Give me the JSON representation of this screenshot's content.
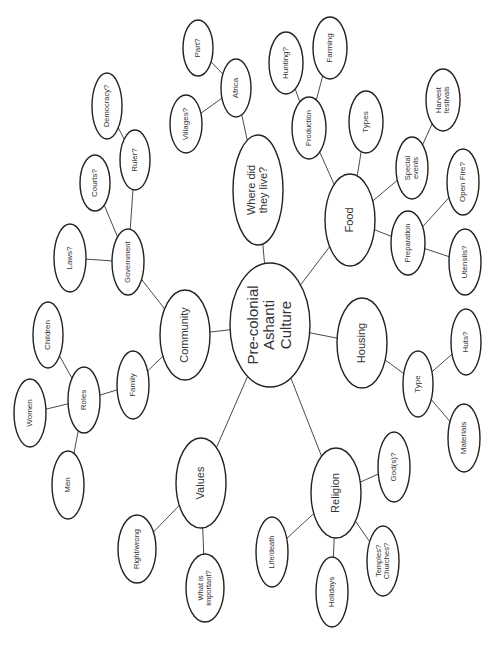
{
  "diagram": {
    "title": "Pre-colonial Ashanti Culture",
    "type": "mind-map",
    "orientation": "rotated-90-ccw",
    "colors": {
      "background": "#ffffff",
      "node_stroke": "#222222",
      "edge_stroke": "#4a4a4a",
      "text": "#333333"
    },
    "nodes": [
      {
        "id": "center",
        "lines": [
          "Pre-colonial",
          "Ashanti",
          "Culture"
        ],
        "cx": 270,
        "cy": 325,
        "rx": 40,
        "ry": 62,
        "size": 15
      },
      {
        "id": "where",
        "lines": [
          "Where did",
          "they live?"
        ],
        "cx": 258,
        "cy": 190,
        "rx": 25,
        "ry": 55,
        "size": 11
      },
      {
        "id": "africa",
        "lines": [
          "Africa"
        ],
        "cx": 236,
        "cy": 88,
        "rx": 15,
        "ry": 29,
        "size": 8
      },
      {
        "id": "part",
        "lines": [
          "Part?"
        ],
        "cx": 198,
        "cy": 48,
        "rx": 15,
        "ry": 28,
        "size": 8
      },
      {
        "id": "villages",
        "lines": [
          "Villages?"
        ],
        "cx": 186,
        "cy": 124,
        "rx": 16,
        "ry": 29,
        "size": 8
      },
      {
        "id": "community",
        "lines": [
          "Community"
        ],
        "cx": 185,
        "cy": 335,
        "rx": 25,
        "ry": 45,
        "size": 11
      },
      {
        "id": "government",
        "lines": [
          "Government"
        ],
        "cx": 128,
        "cy": 262,
        "rx": 16,
        "ry": 33,
        "size": 7.5
      },
      {
        "id": "ruler",
        "lines": [
          "Ruler?"
        ],
        "cx": 135,
        "cy": 160,
        "rx": 15,
        "ry": 30,
        "size": 8
      },
      {
        "id": "democracy",
        "lines": [
          "Democracy?"
        ],
        "cx": 107,
        "cy": 106,
        "rx": 15,
        "ry": 33,
        "size": 7.5
      },
      {
        "id": "courts",
        "lines": [
          "Courts?"
        ],
        "cx": 95,
        "cy": 183,
        "rx": 15,
        "ry": 28,
        "size": 8
      },
      {
        "id": "laws",
        "lines": [
          "Laws?"
        ],
        "cx": 70,
        "cy": 258,
        "rx": 16,
        "ry": 34,
        "size": 8
      },
      {
        "id": "family",
        "lines": [
          "Family"
        ],
        "cx": 133,
        "cy": 385,
        "rx": 16,
        "ry": 34,
        "size": 8
      },
      {
        "id": "roles",
        "lines": [
          "Roles"
        ],
        "cx": 84,
        "cy": 400,
        "rx": 16,
        "ry": 33,
        "size": 8
      },
      {
        "id": "children",
        "lines": [
          "Children"
        ],
        "cx": 48,
        "cy": 335,
        "rx": 15,
        "ry": 33,
        "size": 8
      },
      {
        "id": "women",
        "lines": [
          "Women"
        ],
        "cx": 30,
        "cy": 413,
        "rx": 16,
        "ry": 34,
        "size": 8
      },
      {
        "id": "men",
        "lines": [
          "Men"
        ],
        "cx": 68,
        "cy": 485,
        "rx": 16,
        "ry": 34,
        "size": 8
      },
      {
        "id": "values",
        "lines": [
          "Values"
        ],
        "cx": 201,
        "cy": 483,
        "rx": 25,
        "ry": 45,
        "size": 11
      },
      {
        "id": "rightwrong",
        "lines": [
          "Right/wrong"
        ],
        "cx": 137,
        "cy": 549,
        "rx": 19,
        "ry": 34,
        "size": 7.5
      },
      {
        "id": "important",
        "lines": [
          "What is",
          "important?"
        ],
        "cx": 205,
        "cy": 588,
        "rx": 19,
        "ry": 34,
        "size": 7.5
      },
      {
        "id": "religion",
        "lines": [
          "Religion"
        ],
        "cx": 336,
        "cy": 493,
        "rx": 25,
        "ry": 45,
        "size": 11
      },
      {
        "id": "gods",
        "lines": [
          "God(s)?"
        ],
        "cx": 394,
        "cy": 467,
        "rx": 16,
        "ry": 35,
        "size": 8
      },
      {
        "id": "temples",
        "lines": [
          "Temples?",
          "Churches?"
        ],
        "cx": 383,
        "cy": 561,
        "rx": 16,
        "ry": 35,
        "size": 7.5
      },
      {
        "id": "holidays",
        "lines": [
          "Holidays"
        ],
        "cx": 332,
        "cy": 592,
        "rx": 16,
        "ry": 35,
        "size": 8
      },
      {
        "id": "lifedeath",
        "lines": [
          "Life/death"
        ],
        "cx": 272,
        "cy": 552,
        "rx": 16,
        "ry": 35,
        "size": 7.5
      },
      {
        "id": "housing",
        "lines": [
          "Housing"
        ],
        "cx": 362,
        "cy": 343,
        "rx": 25,
        "ry": 45,
        "size": 11
      },
      {
        "id": "type",
        "lines": [
          "Type"
        ],
        "cx": 418,
        "cy": 384,
        "rx": 15,
        "ry": 33,
        "size": 8
      },
      {
        "id": "huts",
        "lines": [
          "Huts?"
        ],
        "cx": 466,
        "cy": 342,
        "rx": 15,
        "ry": 33,
        "size": 8
      },
      {
        "id": "materials",
        "lines": [
          "Materials"
        ],
        "cx": 464,
        "cy": 438,
        "rx": 16,
        "ry": 34,
        "size": 8
      },
      {
        "id": "food",
        "lines": [
          "Food"
        ],
        "cx": 350,
        "cy": 220,
        "rx": 25,
        "ry": 46,
        "size": 11
      },
      {
        "id": "preparation",
        "lines": [
          "Preparation"
        ],
        "cx": 408,
        "cy": 243,
        "rx": 17,
        "ry": 32,
        "size": 7.5
      },
      {
        "id": "utensils",
        "lines": [
          "Utensils?"
        ],
        "cx": 465,
        "cy": 262,
        "rx": 16,
        "ry": 33,
        "size": 8
      },
      {
        "id": "openfire",
        "lines": [
          "Open Fire?"
        ],
        "cx": 463,
        "cy": 182,
        "rx": 16,
        "ry": 33,
        "size": 8
      },
      {
        "id": "special",
        "lines": [
          "Special",
          "events"
        ],
        "cx": 412,
        "cy": 168,
        "rx": 16,
        "ry": 31,
        "size": 7.5
      },
      {
        "id": "harvest",
        "lines": [
          "Harvest",
          "festivals"
        ],
        "cx": 443,
        "cy": 100,
        "rx": 17,
        "ry": 31,
        "size": 7.5
      },
      {
        "id": "types",
        "lines": [
          "Types"
        ],
        "cx": 366,
        "cy": 122,
        "rx": 17,
        "ry": 31,
        "size": 8
      },
      {
        "id": "production",
        "lines": [
          "Production"
        ],
        "cx": 309,
        "cy": 128,
        "rx": 17,
        "ry": 31,
        "size": 7.5
      },
      {
        "id": "hunting",
        "lines": [
          "Hunting?"
        ],
        "cx": 286,
        "cy": 63,
        "rx": 17,
        "ry": 31,
        "size": 8
      },
      {
        "id": "farming",
        "lines": [
          "Farming"
        ],
        "cx": 330,
        "cy": 48,
        "rx": 17,
        "ry": 31,
        "size": 8
      }
    ],
    "edges": [
      [
        "center",
        "where"
      ],
      [
        "where",
        "africa"
      ],
      [
        "africa",
        "part"
      ],
      [
        "africa",
        "villages"
      ],
      [
        "center",
        "community"
      ],
      [
        "community",
        "government"
      ],
      [
        "government",
        "ruler"
      ],
      [
        "ruler",
        "democracy"
      ],
      [
        "government",
        "courts"
      ],
      [
        "government",
        "laws"
      ],
      [
        "community",
        "family"
      ],
      [
        "family",
        "roles"
      ],
      [
        "roles",
        "children"
      ],
      [
        "roles",
        "women"
      ],
      [
        "roles",
        "men"
      ],
      [
        "center",
        "values"
      ],
      [
        "values",
        "rightwrong"
      ],
      [
        "values",
        "important"
      ],
      [
        "center",
        "religion"
      ],
      [
        "religion",
        "gods"
      ],
      [
        "religion",
        "temples"
      ],
      [
        "religion",
        "holidays"
      ],
      [
        "religion",
        "lifedeath"
      ],
      [
        "center",
        "housing"
      ],
      [
        "housing",
        "type"
      ],
      [
        "type",
        "huts"
      ],
      [
        "type",
        "materials"
      ],
      [
        "center",
        "food"
      ],
      [
        "food",
        "preparation"
      ],
      [
        "preparation",
        "utensils"
      ],
      [
        "preparation",
        "openfire"
      ],
      [
        "food",
        "special"
      ],
      [
        "special",
        "harvest"
      ],
      [
        "food",
        "types"
      ],
      [
        "food",
        "production"
      ],
      [
        "production",
        "hunting"
      ],
      [
        "production",
        "farming"
      ]
    ]
  }
}
